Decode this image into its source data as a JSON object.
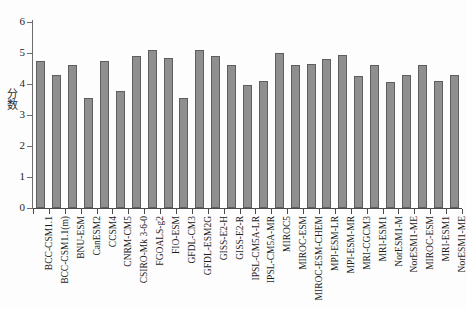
{
  "chart_data": {
    "type": "bar",
    "title": "",
    "subtitle": "",
    "xlabel": "",
    "ylabel": "分数",
    "ylim": [
      0,
      6
    ],
    "ytick_labels": [
      "0",
      "1",
      "2",
      "3",
      "4",
      "5",
      "6"
    ],
    "ytick_values": [
      0,
      1,
      2,
      3,
      4,
      5,
      6
    ],
    "grid": false,
    "legend": false,
    "legend_position": "none",
    "bar_color": "#8f8f8f",
    "bar_edge_color": "#5e5e5e",
    "axis_color": "#4a4a4a",
    "background_color": "#fdfdfd",
    "categories": [
      "BCC-CSM1.1",
      "BCC-CSM1.1(m)",
      "BNU-ESM",
      "CanESM2",
      "CCSM4",
      "CNRM-CM5",
      "CSIRO-Mk 3-6-0",
      "FGOALS-g2",
      "FIO-ESM",
      "GFDL-CM3",
      "GFDL-ESM2G",
      "GISS-E2-H",
      "GISS-E2-R",
      "IPSL-CM5A-LR",
      "IPSL-CM5A-MR",
      "MIROC5",
      "MIROC-ESM",
      "MIROC-ESM-CHEM",
      "MPI-ESM-LR",
      "MPI-ESM-MR",
      "MRI-CGCM3",
      "MRI-ESM1",
      "NorESM1-M",
      "NorESM1-ME"
    ],
    "values": [
      4.75,
      4.28,
      4.6,
      3.55,
      4.75,
      3.78,
      4.9,
      5.1,
      4.85,
      3.55,
      5.1,
      4.9,
      4.6,
      3.98,
      4.1,
      5.0,
      4.6,
      4.65,
      4.8,
      4.95,
      4.25,
      4.6,
      4.05,
      4.3
    ],
    "bar_count": 27,
    "all_values": [
      4.75,
      4.28,
      4.6,
      3.55,
      4.75,
      3.78,
      4.9,
      5.1,
      4.85,
      3.55,
      5.1,
      4.9,
      4.6,
      3.98,
      4.1,
      5.0,
      4.6,
      4.65,
      4.8,
      4.95,
      4.25,
      4.6,
      4.05,
      4.3,
      4.6,
      4.1,
      4.3
    ],
    "all_categories": [
      "BCC-CSM1.1",
      "BCC-CSM1.1(m)",
      "BNU-ESM",
      "CanESM2",
      "CCSM4",
      "CNRM-CM5",
      "CSIRO-Mk 3-6-0",
      "FGOALS-g2",
      "FIO-ESM",
      "GFDL-CM3",
      "GFDL-ESM2G",
      "GISS-E2-H",
      "GISS-E2-R",
      "IPSL-CM5A-LR",
      "IPSL-CM5A-MR",
      "MIROC5",
      "MIROC-ESM",
      "MIROC-ESM-CHEM",
      "MPI-ESM-LR",
      "MPI-ESM-MR",
      "MRI-CGCM3",
      "MRI-ESM1",
      "NorESM1-M",
      "NorESM1-ME",
      "MIROC-ESM",
      "MRI-ESM1",
      "NorESM1-ME"
    ]
  }
}
